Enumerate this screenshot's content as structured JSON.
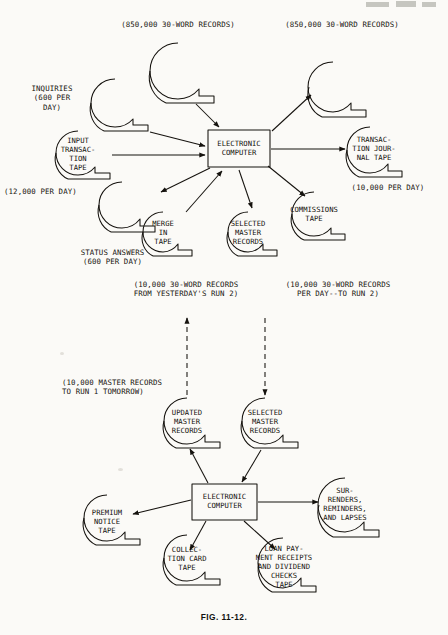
{
  "figure": {
    "caption": "FIG. 11-12."
  },
  "top_run": {
    "processor": {
      "label": "ELECTRONIC\nCOMPUTER"
    },
    "annotations": [
      {
        "id": "master-in-count",
        "text": "(850,000 30-WORD RECORDS)"
      },
      {
        "id": "master-out-count",
        "text": "(850,000 30-WORD RECORDS)"
      },
      {
        "id": "inquiries",
        "text": "INQUIRIES\n(600 PER\nDAY)"
      },
      {
        "id": "input-rate",
        "text": "(12,000 PER DAY)"
      },
      {
        "id": "status-answers",
        "text": "STATUS ANSWERS\n(600 PER DAY)"
      },
      {
        "id": "journal-rate",
        "text": "(10,000 PER DAY)"
      },
      {
        "id": "merge-note",
        "text": "(10,000 30-WORD RECORDS\nFROM YESTERDAY'S RUN 2)"
      },
      {
        "id": "selected-note",
        "text": "(10,000 30-WORD RECORDS\nPER DAY--TO RUN 2)"
      }
    ],
    "tapes": [
      {
        "id": "master-in",
        "label": ""
      },
      {
        "id": "inquiry-tape",
        "label": ""
      },
      {
        "id": "input-transaction",
        "label": "INPUT\nTRANSAC-\nTION\nTAPE"
      },
      {
        "id": "status-answer",
        "label": ""
      },
      {
        "id": "merge-in",
        "label": "MERGE\nIN\nTAPE"
      },
      {
        "id": "selected-master",
        "label": "SELECTED\nMASTER\nRECORDS"
      },
      {
        "id": "master-out",
        "label": ""
      },
      {
        "id": "transaction-journal",
        "label": "TRANSAC-\nTION JOUR-\nNAL TAPE"
      },
      {
        "id": "commissions",
        "label": "COMMISSIONS\nTAPE"
      }
    ]
  },
  "bottom_run": {
    "processor": {
      "label": "ELECTRONIC\nCOMPUTER"
    },
    "annotations": [
      {
        "id": "master-tomorrow",
        "text": "(10,000 MASTER RECORDS\nTO RUN 1 TOMORROW)"
      }
    ],
    "tapes": [
      {
        "id": "updated-master",
        "label": "UPDATED\nMASTER\nRECORDS"
      },
      {
        "id": "selected-master-2",
        "label": "SELECTED\nMASTER\nRECORDS"
      },
      {
        "id": "premium-notice",
        "label": "PREMIUM\nNOTICE\nTAPE"
      },
      {
        "id": "collection-card",
        "label": "COLLEC-\nTION CARD\nTAPE"
      },
      {
        "id": "loan-payment",
        "label": "LOAN PAY-\nMENT RECEIPTS\nAND DIVIDEND\nCHECKS\nTAPE"
      },
      {
        "id": "surrenders",
        "label": "SUR-\nRENDERS,\nREMINDERS,\nAND LAPSES"
      }
    ]
  },
  "style": {
    "ink": "#15120e",
    "paper": "#fbfaf7"
  }
}
